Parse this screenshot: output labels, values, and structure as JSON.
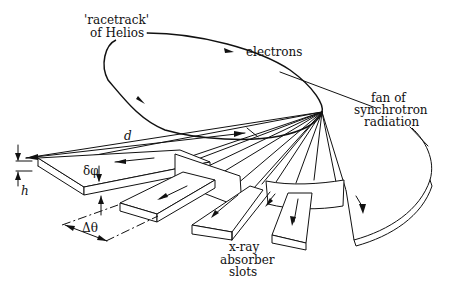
{
  "diagram": {
    "labels": {
      "racetrack_line1": "'racetrack'",
      "racetrack_line2": "of Helios",
      "electrons": "electrons",
      "fan_line1": "fan of",
      "fan_line2": "synchrotron",
      "fan_line3": "radiation",
      "absorber_line1": "x-ray",
      "absorber_line2": "absorber",
      "absorber_line3": "slots",
      "distance": "d",
      "height": "h",
      "delta_phi": "δφ",
      "delta_theta": "Δθ"
    },
    "colors": {
      "ink": "#111111",
      "background": "#ffffff"
    }
  }
}
